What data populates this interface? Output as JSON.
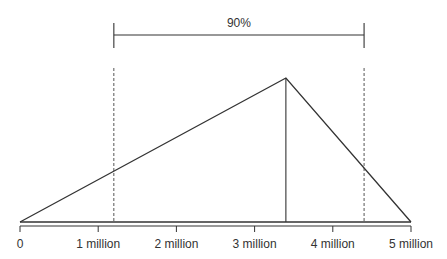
{
  "chart_data": {
    "type": "line",
    "title": "",
    "xlabel": "",
    "ylabel": "",
    "xlim": [
      0,
      5000000
    ],
    "x_tick_labels": [
      "0",
      "1 million",
      "2 million",
      "3 million",
      "4 million",
      "5 million"
    ],
    "x_ticks": [
      0,
      1000000,
      2000000,
      3000000,
      4000000,
      5000000
    ],
    "grid": false,
    "legend": null,
    "series": [
      {
        "name": "triangular distribution",
        "x": [
          0,
          3400000,
          5000000
        ],
        "y": [
          0,
          1,
          0
        ]
      }
    ],
    "reference_lines": [
      {
        "name": "mode",
        "x": 3400000,
        "style": "solid"
      },
      {
        "name": "lower bound 90%",
        "x": 1200000,
        "style": "dashed"
      },
      {
        "name": "upper bound 90%",
        "x": 4400000,
        "style": "dashed"
      }
    ],
    "annotations": [
      {
        "text": "90%",
        "type": "bracket",
        "x_start": 1200000,
        "x_end": 4400000
      }
    ]
  },
  "colors": {
    "line": "#333333",
    "dashed": "#555555",
    "background": "#ffffff"
  }
}
